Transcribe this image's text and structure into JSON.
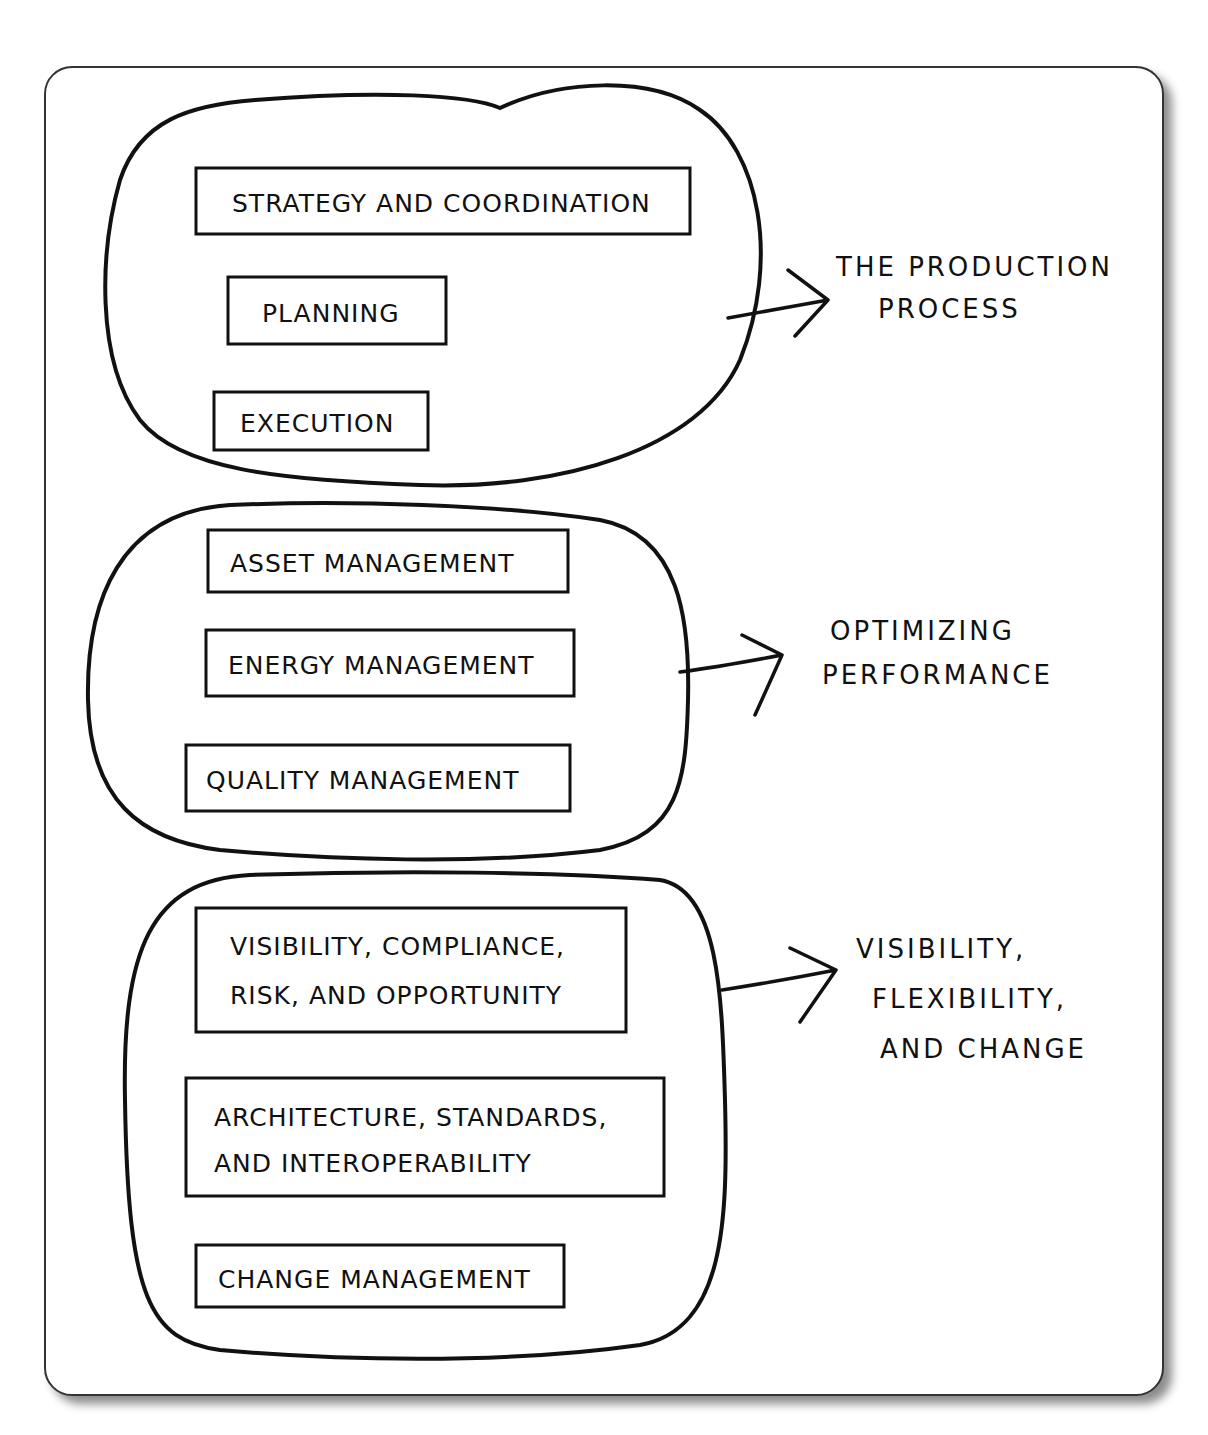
{
  "groups": [
    {
      "items": [
        "STRATEGY AND COORDINATION",
        "PLANNING",
        "EXECUTION"
      ],
      "outcome": [
        "THE PRODUCTION",
        "PROCESS"
      ]
    },
    {
      "items": [
        "ASSET MANAGEMENT",
        "ENERGY MANAGEMENT",
        "QUALITY MANAGEMENT"
      ],
      "outcome": [
        "OPTIMIZING",
        "PERFORMANCE"
      ]
    },
    {
      "items": [
        [
          "VISIBILITY, COMPLIANCE,",
          "RISK, AND OPPORTUNITY"
        ],
        [
          "ARCHITECTURE, STANDARDS,",
          "AND INTEROPERABILITY"
        ],
        "CHANGE MANAGEMENT"
      ],
      "outcome": [
        "VISIBILITY,",
        "FLEXIBILITY,",
        "AND CHANGE"
      ]
    }
  ]
}
